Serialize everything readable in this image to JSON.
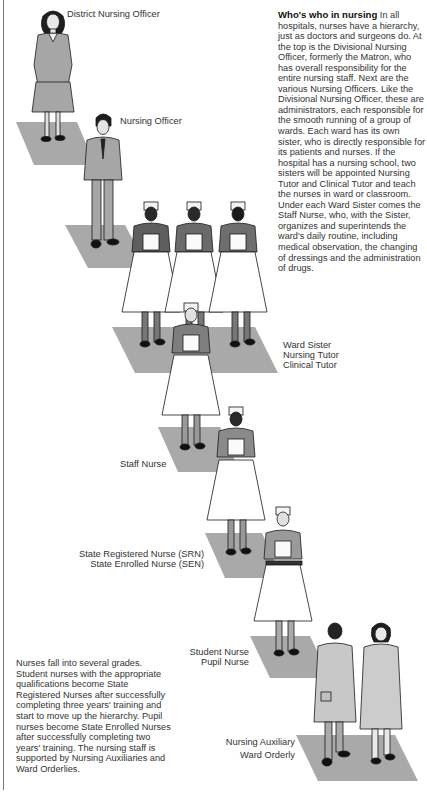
{
  "intro": {
    "heading": "Who's who in nursing",
    "body": "In all hospitals, nurses have a hierarchy, just as doctors and surgeons do. At the top is the Divisional Nursing Officer, formerly the Matron, who has overall responsibility for the entire nursing staff. Next are the various Nursing Officers. Like the Divisional Nursing Officer, these are administrators, each responsible for the smooth running of a group of wards. Each ward has its own sister, who is directly responsible for its patients and nurses. If the hospital has a nursing school, two sisters will be appointed Nursing Tutor and Clinical Tutor and teach the nurses in ward or classroom. Under each Ward Sister comes the Staff Nurse, who, with the Sister, organizes and superintends the ward's daily routine, including medical observation, the changing of dressings and the administration of drugs."
  },
  "labels": {
    "district_nursing_officer": "District Nursing Officer",
    "nursing_officer": "Nursing Officer",
    "ward_sister": "Ward Sister",
    "nursing_tutor": "Nursing Tutor",
    "clinical_tutor": "Clinical Tutor",
    "staff_nurse": "Staff Nurse",
    "srn": "State Registered Nurse (SRN)",
    "sen": "State Enrolled Nurse (SEN)",
    "student_nurse": "Student Nurse",
    "pupil_nurse": "Pupil Nurse",
    "nursing_auxiliary": "Nursing Auxiliary",
    "ward_orderly": "Ward Orderly"
  },
  "footnote": "Nurses fall into several grades. Student nurses with the appropriate qualifications become State Registered Nurses after successfully completing three years' training and start to move up the hierarchy. Pupil nurses become State Enrolled Nurses after successfully completing two years' training. The nursing staff is supported by Nursing Auxiliaries and Ward Orderlies.",
  "colors": {
    "floor": "#a9a9a9",
    "suit": "#a6a6a6",
    "uniform_dark": "#6e6e6e",
    "uniform_mid": "#8a8a8a",
    "uniform_light": "#9a9a9a",
    "coat": "#c8c8c8",
    "ink": "#1a1a1a"
  }
}
